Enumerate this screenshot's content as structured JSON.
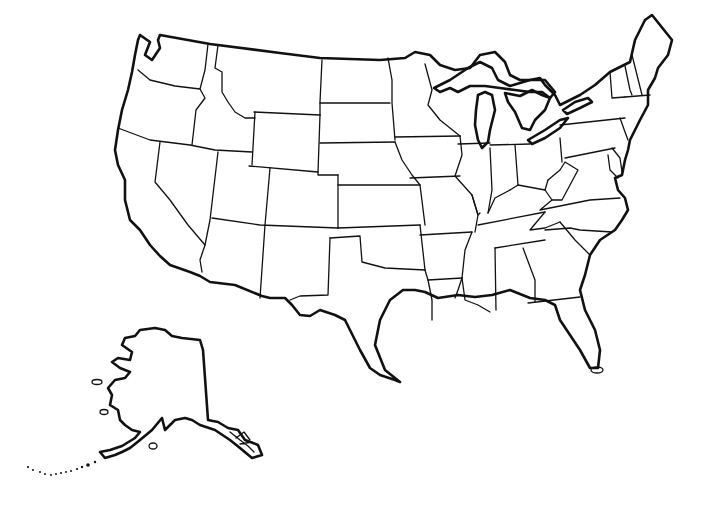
{
  "map": {
    "title": "Blank outline map of the United States",
    "type": "political outline",
    "labels_visible": false,
    "stroke_color": "#111111",
    "background_color": "#ffffff",
    "regions": [
      "contiguous-us",
      "alaska"
    ]
  }
}
